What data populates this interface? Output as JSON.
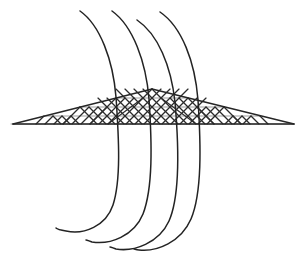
{
  "figure": {
    "title": "",
    "background_color": "#ffffff",
    "line_color": "#232323",
    "grid_color": "#2b2b2b",
    "grid_soft_color": "#8d8d8d",
    "width": 301,
    "height": 260
  },
  "plane": {
    "name": "perspective-grid-plane",
    "apex": {
      "x": 152,
      "y": 89
    },
    "left_tip": {
      "x": 13,
      "y": 124
    },
    "right_tip": {
      "x": 294,
      "y": 124
    },
    "baseline_y": 124,
    "rows": 4,
    "columns": 8,
    "cell_shape": "diamond",
    "row_y": [
      89,
      98,
      107,
      116,
      124
    ],
    "row_half_width": [
      0,
      36,
      72,
      108,
      141
    ]
  },
  "field_lines": [
    {
      "id": "field-line-1",
      "label": "field line 1",
      "top": {
        "x": 80,
        "y": 11
      },
      "plane_crossing": {
        "x": 115,
        "y": 118
      },
      "bottom_tip": {
        "x": 56,
        "y": 228
      },
      "path": "M 80,11 C 100,25 113,60 116,97 C 119,140 121,180 113,205 C 106,226 84,235 66,231 C 60,230 57,229 56,228"
    },
    {
      "id": "field-line-2",
      "label": "field line 2",
      "top": {
        "x": 112,
        "y": 11
      },
      "plane_crossing": {
        "x": 148,
        "y": 118
      },
      "bottom_tip": {
        "x": 86,
        "y": 240
      },
      "path": "M 112,11 C 133,26 146,62 149,99 C 152,144 153,188 143,214 C 134,236 110,245 92,242 C 89,241 87,240 86,240"
    },
    {
      "id": "field-line-3",
      "label": "field line 3",
      "top": {
        "x": 137,
        "y": 20
      },
      "plane_crossing": {
        "x": 174,
        "y": 118
      },
      "bottom_tip": {
        "x": 110,
        "y": 247
      },
      "path": "M 137,20 C 158,34 171,66 175,102 C 179,148 180,196 169,221 C 159,243 134,252 116,249 C 113,248 111,247 110,247"
    },
    {
      "id": "field-line-4",
      "label": "field line 4",
      "top": {
        "x": 160,
        "y": 12
      },
      "plane_crossing": {
        "x": 197,
        "y": 118
      },
      "bottom_tip": {
        "x": 134,
        "y": 249
      },
      "path": "M 160,12 C 182,27 195,62 198,100 C 201,146 202,193 191,219 C 181,242 157,252 139,250 C 136,250 135,249 134,249"
    }
  ],
  "annotations": []
}
